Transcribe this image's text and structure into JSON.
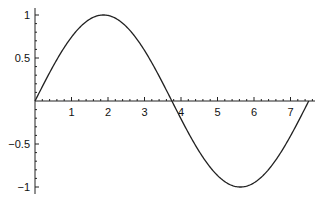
{
  "chart_data": {
    "type": "line",
    "title": "",
    "xlabel": "",
    "ylabel": "",
    "function": "sin(2*pi*x/7.5)",
    "xlim": [
      0,
      7.65
    ],
    "ylim": [
      -1.07,
      1.07
    ],
    "x_ticks": [
      1,
      2,
      3,
      4,
      5,
      6,
      7
    ],
    "x_tick_labels": [
      "1",
      "2",
      "3",
      "4",
      "5",
      "6",
      "7"
    ],
    "y_ticks": [
      1,
      0.5,
      -0.5,
      -1
    ],
    "y_tick_labels": [
      "1",
      "0.5",
      "−0.5",
      "−1"
    ],
    "grid": false,
    "legend": null,
    "series": [
      {
        "name": "curve",
        "color": "#222222",
        "x": [
          0,
          0.5,
          1,
          1.5,
          1.875,
          2.5,
          3,
          3.5,
          3.75,
          4,
          4.5,
          5,
          5.625,
          6,
          6.5,
          7,
          7.5
        ],
        "y": [
          0,
          0.407,
          0.743,
          0.951,
          1,
          0.866,
          0.588,
          0.208,
          0,
          -0.208,
          -0.588,
          -0.866,
          -1,
          -0.951,
          -0.743,
          -0.407,
          0
        ]
      }
    ]
  },
  "layout": {
    "origin_px": [
      35,
      101
    ],
    "px_per_x": 36.5,
    "px_per_y": 86,
    "x_axis_end_px": 315,
    "y_axis_top_px": 8,
    "y_axis_bottom_px": 194
  }
}
